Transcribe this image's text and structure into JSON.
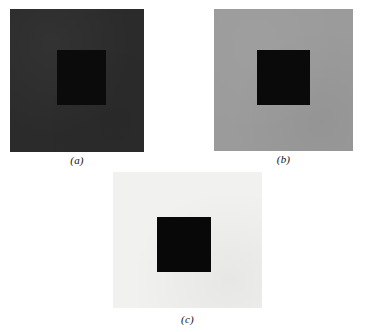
{
  "figure": {
    "background_color": "#ffffff",
    "width": 365,
    "height": 332,
    "panels": [
      {
        "id": "a",
        "label": "(a)",
        "surround_color": "#2b2b2b",
        "surround_description": "dark gray surround",
        "inner_color": "#0b0b0b",
        "inner_description": "black central square"
      },
      {
        "id": "b",
        "label": "(b)",
        "surround_color": "#9b9b9b",
        "surround_description": "medium gray surround",
        "inner_color": "#0a0a0a",
        "inner_description": "black central square"
      },
      {
        "id": "c",
        "label": "(c)",
        "surround_color": "#f1f1ef",
        "surround_description": "light gray / near-white surround",
        "inner_color": "#080808",
        "inner_description": "black central square"
      }
    ]
  }
}
